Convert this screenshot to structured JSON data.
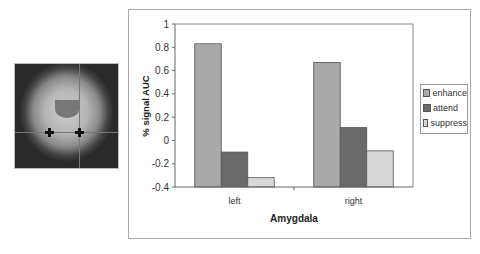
{
  "image": {
    "description": "coronal brain MRI slice with crosshair and two amygdala markers"
  },
  "chart_data": {
    "type": "bar",
    "title": "",
    "xlabel": "Amygdala",
    "ylabel": "% signal AUC",
    "categories": [
      "left",
      "right"
    ],
    "series": [
      {
        "name": "enhance",
        "values": [
          0.83,
          0.67
        ],
        "color": "#a9a9a9"
      },
      {
        "name": "attend",
        "values": [
          -0.1,
          0.11
        ],
        "color": "#6a6a6a"
      },
      {
        "name": "suppress",
        "values": [
          -0.32,
          -0.09
        ],
        "color": "#d8d8d8"
      }
    ],
    "ylim": [
      -0.4,
      1
    ],
    "yticks": [
      -0.4,
      -0.2,
      0,
      0.2,
      0.4,
      0.6,
      0.8,
      1
    ],
    "ytick_labels": [
      "-0.4",
      "-0.2",
      "0",
      "0.2",
      "0.4",
      "0.6",
      "0.8",
      "1"
    ],
    "grid": false,
    "legend_position": "right"
  }
}
